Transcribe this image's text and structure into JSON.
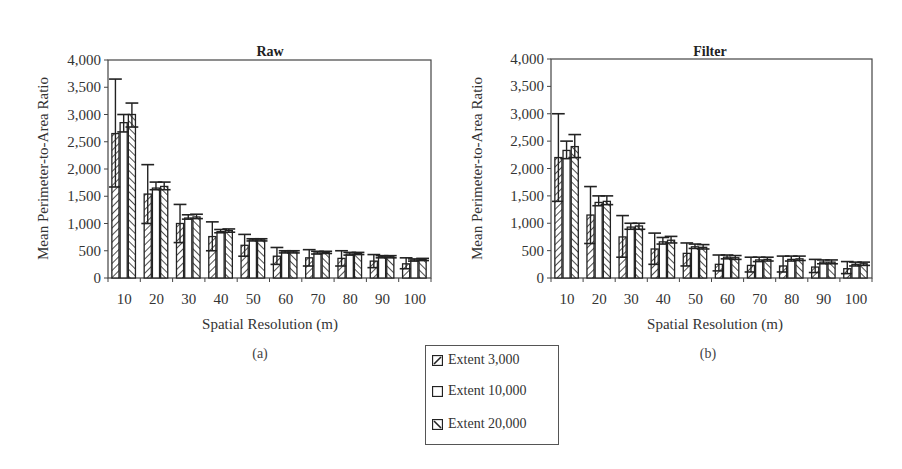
{
  "chart_data": [
    {
      "type": "bar",
      "title": "Raw",
      "panel_label": "(a)",
      "xlabel": "Spatial Resolution (m)",
      "ylabel": "Mean Perimeter-to-Area Ratio",
      "ylim": [
        0,
        4000
      ],
      "yticks": [
        "0",
        "500",
        "1,000",
        "1,500",
        "2,000",
        "2,500",
        "3,000",
        "3,500",
        "4,000"
      ],
      "categories": [
        "10",
        "20",
        "30",
        "40",
        "50",
        "60",
        "70",
        "80",
        "90",
        "100"
      ],
      "grid": false,
      "series": [
        {
          "name": "Extent 3,000",
          "values": [
            2650,
            1540,
            1000,
            760,
            600,
            400,
            370,
            360,
            310,
            260
          ],
          "err_low": [
            1670,
            1000,
            650,
            500,
            400,
            250,
            220,
            220,
            190,
            170
          ],
          "err_high": [
            3650,
            2080,
            1350,
            1030,
            800,
            560,
            520,
            500,
            430,
            370
          ]
        },
        {
          "name": "Extent 10,000",
          "values": [
            2850,
            1650,
            1100,
            850,
            700,
            480,
            460,
            440,
            390,
            330
          ],
          "err_low": [
            2680,
            1620,
            1080,
            830,
            680,
            460,
            440,
            420,
            370,
            310
          ],
          "err_high": [
            3000,
            1760,
            1160,
            890,
            720,
            500,
            490,
            470,
            410,
            350
          ]
        },
        {
          "name": "Extent 20,000",
          "values": [
            3000,
            1680,
            1120,
            870,
            700,
            480,
            470,
            450,
            390,
            340
          ],
          "err_low": [
            2770,
            1620,
            1090,
            840,
            680,
            460,
            450,
            430,
            370,
            320
          ],
          "err_high": [
            3210,
            1760,
            1170,
            900,
            720,
            500,
            490,
            470,
            410,
            360
          ]
        }
      ]
    },
    {
      "type": "bar",
      "title": "Filter",
      "panel_label": "(b)",
      "xlabel": "Spatial Resolution (m)",
      "ylabel": "Mean Perimeter-to-Area Ratio",
      "ylim": [
        0,
        4000
      ],
      "yticks": [
        "0",
        "500",
        "1,000",
        "1,500",
        "2,000",
        "2,500",
        "3,000",
        "3,500",
        "4,000"
      ],
      "categories": [
        "10",
        "20",
        "30",
        "40",
        "50",
        "60",
        "70",
        "80",
        "90",
        "100"
      ],
      "grid": false,
      "series": [
        {
          "name": "Extent 3,000",
          "values": [
            2200,
            1150,
            750,
            530,
            450,
            250,
            230,
            220,
            200,
            170
          ],
          "err_low": [
            1400,
            630,
            380,
            250,
            220,
            130,
            110,
            110,
            100,
            80
          ],
          "err_high": [
            3000,
            1670,
            1140,
            820,
            640,
            420,
            380,
            400,
            340,
            300
          ]
        },
        {
          "name": "Extent 10,000",
          "values": [
            2330,
            1380,
            930,
            660,
            570,
            380,
            330,
            340,
            290,
            250
          ],
          "err_low": [
            2180,
            1320,
            890,
            620,
            540,
            350,
            300,
            310,
            260,
            220
          ],
          "err_high": [
            2500,
            1500,
            1000,
            740,
            620,
            420,
            380,
            400,
            330,
            290
          ]
        },
        {
          "name": "Extent 20,000",
          "values": [
            2400,
            1400,
            950,
            690,
            560,
            370,
            340,
            350,
            290,
            260
          ],
          "err_low": [
            2200,
            1340,
            890,
            640,
            530,
            340,
            310,
            320,
            260,
            230
          ],
          "err_high": [
            2620,
            1500,
            1000,
            760,
            610,
            410,
            380,
            400,
            330,
            290
          ]
        }
      ]
    }
  ],
  "legend": {
    "items": [
      {
        "label": "Extent 3,000",
        "pattern": "diag-right"
      },
      {
        "label": "Extent 10,000",
        "pattern": "empty"
      },
      {
        "label": "Extent 20,000",
        "pattern": "diag-left"
      }
    ]
  },
  "colors": {
    "bar_stroke": "#222222",
    "axis": "#333333",
    "text": "#333333",
    "background": "#ffffff"
  }
}
